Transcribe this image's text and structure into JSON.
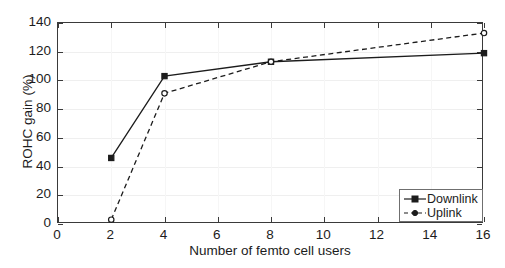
{
  "chart_data": {
    "type": "line",
    "title": "",
    "xlabel": "Number of femto cell users",
    "ylabel": "ROHC gain (%)",
    "xlim": [
      0,
      16
    ],
    "ylim": [
      0,
      140
    ],
    "xticks": [
      0,
      2,
      4,
      6,
      8,
      10,
      12,
      14,
      16
    ],
    "yticks": [
      0,
      20,
      40,
      60,
      80,
      100,
      120,
      140
    ],
    "xtick_labels": [
      "0",
      "2",
      "4",
      "6",
      "8",
      "10",
      "12",
      "14",
      "16"
    ],
    "ytick_labels": [
      "0",
      "20",
      "40",
      "60",
      "80",
      "100",
      "120",
      "140"
    ],
    "grid": true,
    "legend_position": "lower right",
    "x": [
      2,
      4,
      8,
      16
    ],
    "series": [
      {
        "name": "Downlink",
        "values": [
          46,
          103,
          113,
          119
        ],
        "linestyle": "solid",
        "marker": "square",
        "color": "#1c1c1c"
      },
      {
        "name": "Uplink",
        "values": [
          3,
          91,
          113,
          133
        ],
        "linestyle": "dashed",
        "marker": "circle",
        "color": "#1c1c1c"
      }
    ]
  },
  "legend": {
    "entries": [
      {
        "label": "Downlink"
      },
      {
        "label": "Uplink"
      }
    ]
  },
  "colors": {
    "axis": "#3a3a3a",
    "grid": "#efefef",
    "series": "#1c1c1c",
    "background": "#ffffff"
  }
}
